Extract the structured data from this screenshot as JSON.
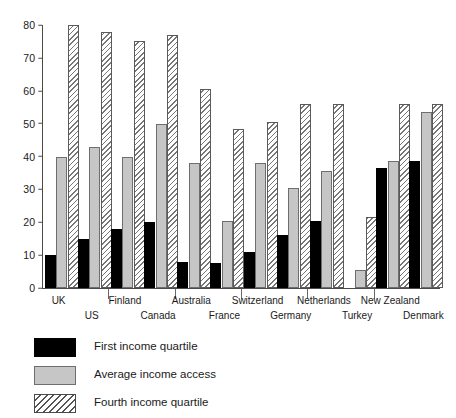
{
  "chart_data": {
    "type": "bar",
    "title": "",
    "subtitle": "",
    "xlabel": "",
    "ylabel": "",
    "ylim": [
      0,
      80
    ],
    "yticks": [
      0,
      10,
      20,
      30,
      40,
      50,
      60,
      70,
      80
    ],
    "grid": false,
    "legend_position": "bottom-left",
    "categories": [
      "UK",
      "US",
      "Finland",
      "Canada",
      "Australia",
      "France",
      "Switzerland",
      "Germany",
      "Netherlands",
      "Turkey",
      "New Zealand",
      "Denmark"
    ],
    "series": [
      {
        "name": "First income quartile",
        "key": "first",
        "color": "#000000",
        "values": [
          10,
          15,
          18,
          20,
          8,
          7.5,
          11,
          16,
          20.5,
          null,
          36.5,
          38.5
        ]
      },
      {
        "name": "Average income access",
        "key": "avg",
        "color": "#c6c6c6",
        "values": [
          40,
          43,
          40,
          50,
          38,
          20.5,
          38,
          30.5,
          35.5,
          5.5,
          38.5,
          53.5
        ]
      },
      {
        "name": "Fourth income quartile",
        "key": "fourth",
        "color": "#ffffff",
        "values": [
          80,
          78,
          75,
          77,
          60.5,
          48.5,
          50.5,
          56,
          56,
          21.5,
          56,
          56
        ]
      }
    ]
  },
  "legend": {
    "items": [
      {
        "label": "First income quartile",
        "swatch": "first"
      },
      {
        "label": "Average income access",
        "swatch": "avg"
      },
      {
        "label": "Fourth income quartile",
        "swatch": "fourth"
      }
    ]
  },
  "colors": {
    "first": "#000000",
    "average": "#c6c6c6",
    "fourth_hatch": "#777777",
    "axis": "#4a4a4a",
    "text": "#1a1a1a",
    "background": "#ffffff"
  }
}
